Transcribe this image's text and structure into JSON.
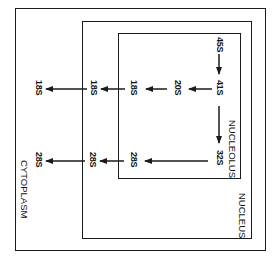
{
  "diagram": {
    "orientation": "rotated 90deg clockwise",
    "compartments": {
      "cytoplasm": "CYTOPLASM",
      "nucleus": "NUCLEUS",
      "nucleolus": "NUCLEOLUS"
    },
    "nodes": {
      "n45s": "45S",
      "n41s": "41S",
      "n20s": "20S",
      "n32s": "32S",
      "n18s_nucleolus": "18S",
      "n18s_nucleus": "18S",
      "n18s_cytoplasm": "18S",
      "n28s_nucleolus": "28S",
      "n28s_nucleus": "28S",
      "n28s_cytoplasm": "28S"
    },
    "edges": [
      {
        "from": "45S",
        "to": "41S"
      },
      {
        "from": "41S",
        "to": "20S"
      },
      {
        "from": "41S",
        "to": "32S"
      },
      {
        "from": "20S",
        "to": "18S (nucleolus)"
      },
      {
        "from": "18S (nucleolus)",
        "to": "18S (nucleus)"
      },
      {
        "from": "18S (nucleus)",
        "to": "18S (cytoplasm)"
      },
      {
        "from": "32S",
        "to": "28S (nucleolus)"
      },
      {
        "from": "28S (nucleolus)",
        "to": "28S (nucleus)"
      },
      {
        "from": "28S (nucleus)",
        "to": "28S (cytoplasm)"
      }
    ],
    "colors": {
      "line": "#1a1a1a",
      "background": "#ffffff"
    }
  }
}
